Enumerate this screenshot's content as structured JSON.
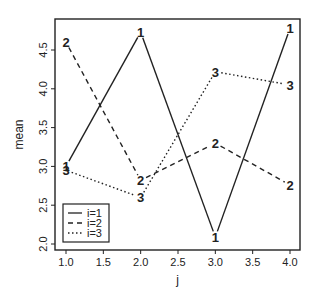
{
  "chart_data": {
    "type": "line",
    "title": "",
    "xlabel": "j",
    "ylabel": "mean",
    "x": [
      1,
      2,
      3,
      4
    ],
    "xlim": [
      0.85,
      4.15
    ],
    "ylim": [
      2.0,
      4.9
    ],
    "xticks": [
      "1.0",
      "1.5",
      "2.0",
      "2.5",
      "3.0",
      "3.5",
      "4.0"
    ],
    "xtick_values": [
      1.0,
      1.5,
      2.0,
      2.5,
      3.0,
      3.5,
      4.0
    ],
    "yticks": [
      "2.0",
      "2.5",
      "3.0",
      "3.5",
      "4.0",
      "4.5"
    ],
    "ytick_values": [
      2.0,
      2.5,
      3.0,
      3.5,
      4.0,
      4.5
    ],
    "grid": false,
    "legend_position": "bottom-left",
    "series": [
      {
        "name": "i=1",
        "marker": "1",
        "linestyle": "solid",
        "values": [
          3.0,
          4.73,
          2.09,
          4.78
        ]
      },
      {
        "name": "i=2",
        "marker": "2",
        "linestyle": "dashed",
        "values": [
          4.6,
          2.82,
          3.3,
          2.76
        ]
      },
      {
        "name": "i=3",
        "marker": "3",
        "linestyle": "dotted",
        "values": [
          2.95,
          2.6,
          4.22,
          4.05
        ]
      }
    ]
  }
}
